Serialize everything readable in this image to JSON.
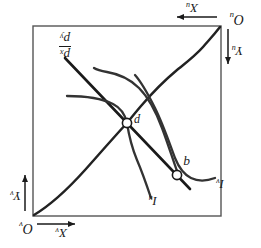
{
  "figure": {
    "type": "edgeworth-box-diagram",
    "orientation_note_degrees": 180,
    "box": {
      "x": 40,
      "y": 32,
      "width": 188,
      "height": 190
    },
    "labels": {
      "origin_u": {
        "base": "O",
        "sub": "u"
      },
      "origin_v": {
        "base": "O",
        "sub": "v"
      },
      "axis_x_u": {
        "base": "X",
        "sub": "u"
      },
      "axis_y_u": {
        "base": "Y",
        "sub": "u"
      },
      "axis_x_v": {
        "base": "X",
        "sub": "v"
      },
      "axis_y_v": {
        "base": "Y",
        "sub": "v"
      },
      "indifference_u": {
        "base": "I",
        "sub": "u"
      },
      "indifference_v": {
        "base": "I",
        "sub": "v"
      },
      "point_q": "q",
      "point_p": "p",
      "price_ratio_numerator": {
        "base": "p",
        "sub": "x"
      },
      "price_ratio_denominator": {
        "base": "p",
        "sub": "y"
      }
    },
    "points": [
      {
        "name": "q",
        "x": 84,
        "y": 73,
        "label": "q"
      },
      {
        "name": "p",
        "x": 134,
        "y": 125,
        "label": "p"
      }
    ],
    "colors": {
      "ink": "#1a1a1a",
      "curve": "#222222",
      "box_border": "#555555",
      "background": "#ffffff"
    }
  }
}
